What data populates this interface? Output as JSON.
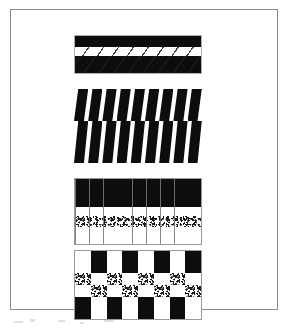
{
  "figure": {
    "background_color": "#ffffff",
    "frame_color": "#8a8a8a",
    "ink_color": "#0d0d0d",
    "caption": ""
  },
  "swatches": [
    {
      "id": "banded-twill",
      "name": "Banded twill swatch",
      "bands": [
        {
          "label": "solid black band",
          "fill": "black"
        },
        {
          "label": "white band with diagonal twill lines",
          "fill": "white-hatched"
        },
        {
          "label": "wide solid black band",
          "fill": "black"
        }
      ]
    },
    {
      "id": "zigzag-strips",
      "name": "Sheared zigzag strip swatch",
      "strip_count": 9,
      "segments_per_strip": 2,
      "fill": "black"
    },
    {
      "id": "column-grid",
      "name": "Column grid swatch with speckle band",
      "column_count": 9,
      "rows": [
        {
          "label": "black band",
          "fill": "black"
        },
        {
          "label": "white band",
          "fill": "white"
        },
        {
          "label": "speckled band",
          "fill": "speckle"
        },
        {
          "label": "white band",
          "fill": "white"
        }
      ]
    },
    {
      "id": "checkerboard",
      "name": "Checkerboard swatch with speckle rows",
      "column_count": 8,
      "row_count": 4,
      "grid": [
        [
          "white",
          "black",
          "white",
          "black",
          "white",
          "black",
          "white",
          "black"
        ],
        [
          "speckle",
          "white",
          "speckle",
          "white",
          "speckle",
          "white",
          "speckle",
          "white"
        ],
        [
          "white",
          "speckle",
          "white",
          "speckle",
          "white",
          "speckle",
          "white",
          "speckle"
        ],
        [
          "black",
          "white",
          "black",
          "white",
          "black",
          "white",
          "black",
          "white"
        ]
      ]
    }
  ]
}
